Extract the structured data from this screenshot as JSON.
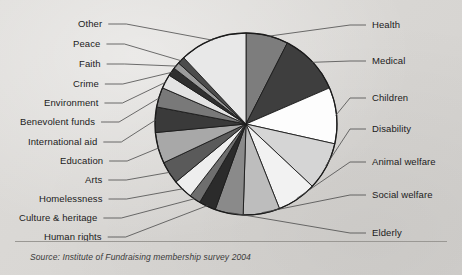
{
  "figure": {
    "source_note": "Source: Institute of Fundraising membership survey 2004",
    "background_color": "#d9d7d4",
    "outline_color": "#1b1b1b",
    "leader_line_color": "#4a4a4a"
  },
  "chart_data": {
    "type": "pie",
    "title": "",
    "subtitle": "",
    "xlabel": "",
    "ylabel": "",
    "legend_position": "leader-labels",
    "grid": false,
    "units": "percent",
    "center": {
      "x": 246,
      "y": 124
    },
    "radius": 91,
    "start_angle_deg": -90,
    "direction": "clockwise",
    "categories": [
      "Health",
      "Medical",
      "Children",
      "Disability",
      "Animal welfare",
      "Social welfare",
      "Elderly",
      "Human rights",
      "Culture & heritage",
      "Homelessness",
      "Arts",
      "Education",
      "International aid",
      "Benevolent funds",
      "Environment",
      "Crime",
      "Faith",
      "Peace",
      "Other"
    ],
    "values": [
      7.5,
      11.0,
      10.0,
      8.5,
      7.0,
      6.5,
      5.0,
      3.0,
      2.0,
      3.5,
      4.0,
      5.5,
      4.5,
      3.5,
      2.5,
      1.5,
      1.2,
      1.3,
      12.0
    ],
    "slice_colors": [
      "#7d7d7d",
      "#3e3e3e",
      "#fdfdfd",
      "#d5d5d5",
      "#f2f2f2",
      "#bdbdbd",
      "#8a8a8a",
      "#2b2b2b",
      "#6e6e6e",
      "#eeeeee",
      "#5a5a5a",
      "#a8a8a8",
      "#3a3a3a",
      "#797979",
      "#e3e3e3",
      "#2f2f2f",
      "#9c9c9c",
      "#4c4c4c",
      "#e8e8e8"
    ]
  },
  "labels": {
    "left": [
      {
        "text": "Other",
        "x": 78,
        "y": 18
      },
      {
        "text": "Peace",
        "x": 73,
        "y": 38
      },
      {
        "text": "Faith",
        "x": 79,
        "y": 58
      },
      {
        "text": "Crime",
        "x": 73,
        "y": 78
      },
      {
        "text": "Environment",
        "x": 44,
        "y": 97
      },
      {
        "text": "Benevolent funds",
        "x": 20,
        "y": 116
      },
      {
        "text": "International aid",
        "x": 28,
        "y": 136
      },
      {
        "text": "Education",
        "x": 60,
        "y": 155
      },
      {
        "text": "Arts",
        "x": 85,
        "y": 174
      },
      {
        "text": "Homelessness",
        "x": 39,
        "y": 193
      },
      {
        "text": "Culture & heritage",
        "x": 19,
        "y": 212
      },
      {
        "text": "Human rights",
        "x": 44,
        "y": 231
      }
    ],
    "right": [
      {
        "text": "Health",
        "x": 372,
        "y": 19
      },
      {
        "text": "Medical",
        "x": 372,
        "y": 55
      },
      {
        "text": "Children",
        "x": 372,
        "y": 92
      },
      {
        "text": "Disability",
        "x": 372,
        "y": 123
      },
      {
        "text": "Animal welfare",
        "x": 372,
        "y": 156
      },
      {
        "text": "Social welfare",
        "x": 372,
        "y": 189
      },
      {
        "text": "Elderly",
        "x": 372,
        "y": 227
      }
    ]
  }
}
